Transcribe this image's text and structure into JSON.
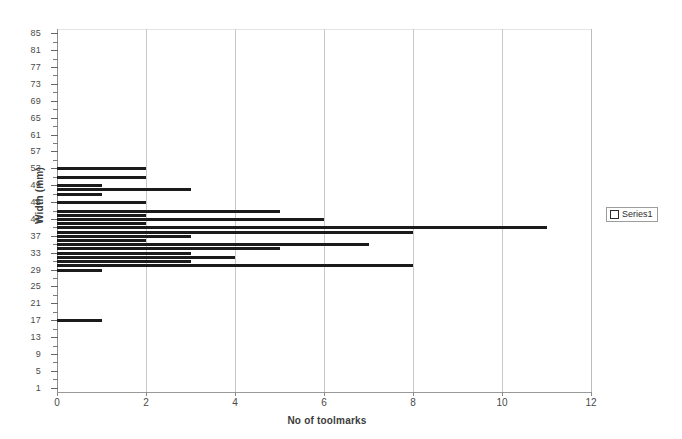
{
  "chart_data": {
    "type": "bar",
    "orientation": "horizontal",
    "title": "",
    "xlabel": "No of toolmarks",
    "ylabel": "Width (mm)",
    "xlim": [
      0,
      12
    ],
    "ylim": [
      0,
      86
    ],
    "xticks": [
      0,
      2,
      4,
      6,
      8,
      10,
      12
    ],
    "ytick_labels": [
      85,
      81,
      77,
      73,
      69,
      65,
      61,
      57,
      53,
      49,
      45,
      41,
      37,
      33,
      29,
      25,
      21,
      17,
      13,
      9,
      5,
      1
    ],
    "ytick_step": 4,
    "minor_ytick_step": 2,
    "grid": "vertical",
    "legend_position": "right",
    "legend_entries": [
      "Series1"
    ],
    "bar_color": "#1b1b1b",
    "categories": [
      53,
      52,
      51,
      50,
      49,
      48,
      47,
      46,
      45,
      44,
      43,
      42,
      41,
      40,
      39,
      38,
      37,
      36,
      35,
      34,
      33,
      32,
      31,
      30,
      29,
      17
    ],
    "values": [
      2,
      0,
      2,
      0,
      1,
      3,
      1,
      0,
      2,
      0,
      5,
      2,
      6,
      2,
      11,
      8,
      3,
      2,
      7,
      5,
      3,
      4,
      3,
      8,
      1,
      1
    ],
    "series": [
      {
        "name": "Series1",
        "points": [
          {
            "width": 53,
            "toolmarks": 2
          },
          {
            "width": 51,
            "toolmarks": 2
          },
          {
            "width": 49,
            "toolmarks": 1
          },
          {
            "width": 48,
            "toolmarks": 3
          },
          {
            "width": 47,
            "toolmarks": 1
          },
          {
            "width": 45,
            "toolmarks": 2
          },
          {
            "width": 43,
            "toolmarks": 5
          },
          {
            "width": 42,
            "toolmarks": 2
          },
          {
            "width": 41,
            "toolmarks": 6
          },
          {
            "width": 40,
            "toolmarks": 2
          },
          {
            "width": 39,
            "toolmarks": 11
          },
          {
            "width": 38,
            "toolmarks": 8
          },
          {
            "width": 37,
            "toolmarks": 3
          },
          {
            "width": 36,
            "toolmarks": 2
          },
          {
            "width": 35,
            "toolmarks": 7
          },
          {
            "width": 34,
            "toolmarks": 5
          },
          {
            "width": 33,
            "toolmarks": 3
          },
          {
            "width": 32,
            "toolmarks": 4
          },
          {
            "width": 31,
            "toolmarks": 3
          },
          {
            "width": 30,
            "toolmarks": 8
          },
          {
            "width": 29,
            "toolmarks": 1
          },
          {
            "width": 17,
            "toolmarks": 1
          }
        ]
      }
    ]
  },
  "axes": {
    "y_title": "Width (mm)",
    "x_title": "No of toolmarks",
    "y_labels": [
      "85",
      "81",
      "77",
      "73",
      "69",
      "65",
      "61",
      "57",
      "53",
      "49",
      "45",
      "41",
      "37",
      "33",
      "29",
      "25",
      "21",
      "17",
      "13",
      "9",
      "5",
      "1"
    ],
    "x_labels": [
      "0",
      "2",
      "4",
      "6",
      "8",
      "10",
      "12"
    ]
  },
  "legend": {
    "label": "Series1",
    "marker": "hollow-square-icon"
  }
}
